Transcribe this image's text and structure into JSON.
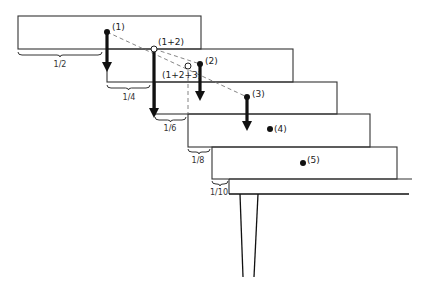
{
  "diagram": {
    "colors": {
      "stroke": "#333333",
      "arrow": "#111111",
      "dash": "#777777",
      "background": "#ffffff"
    },
    "blocks": [
      {
        "id": 1,
        "x": 18,
        "y": 16,
        "w": 183,
        "h": 33
      },
      {
        "id": 2,
        "x": 107,
        "y": 49,
        "w": 186,
        "h": 33
      },
      {
        "id": 3,
        "x": 155,
        "y": 82,
        "w": 182,
        "h": 32
      },
      {
        "id": 4,
        "x": 188,
        "y": 114,
        "w": 182,
        "h": 33
      },
      {
        "id": 5,
        "x": 212,
        "y": 147,
        "w": 185,
        "h": 32
      }
    ],
    "table": {
      "top_y": 179,
      "bottom_y": 194,
      "left_x": 229,
      "right_top_x": 412,
      "right_bottom_x": 409
    },
    "legs": [
      {
        "x1": 240,
        "y1": 194,
        "x2": 243,
        "y2": 277
      },
      {
        "x1": 258,
        "y1": 194,
        "x2": 254,
        "y2": 277
      }
    ],
    "points": [
      {
        "label": "(1)",
        "x": 107,
        "y": 32,
        "type": "filled",
        "label_dx": 5,
        "label_dy": -2
      },
      {
        "label": "(1+2)",
        "x": 154,
        "y": 49,
        "type": "open",
        "label_dx": 4,
        "label_dy": -4
      },
      {
        "label": "(1+2+3)",
        "x": 188,
        "y": 66,
        "type": "open",
        "label_dx": -26,
        "label_dy": 12
      },
      {
        "label": "(2)",
        "x": 200,
        "y": 64,
        "type": "filled",
        "label_dx": 5,
        "label_dy": 0
      },
      {
        "label": "(3)",
        "x": 247,
        "y": 97,
        "type": "filled",
        "label_dx": 5,
        "label_dy": 0
      },
      {
        "label": "(4)",
        "x": 270,
        "y": 129,
        "type": "filled",
        "label_dx": 4,
        "label_dy": 3
      },
      {
        "label": "(5)",
        "x": 303,
        "y": 163,
        "type": "filled",
        "label_dx": 4,
        "label_dy": 0
      }
    ],
    "arrows": [
      {
        "x": 107,
        "y1": 32,
        "y2": 72
      },
      {
        "x": 154,
        "y1": 49,
        "y2": 118
      },
      {
        "x": 200,
        "y1": 64,
        "y2": 101
      },
      {
        "x": 247,
        "y1": 97,
        "y2": 131
      }
    ],
    "dashed_lines": [
      {
        "x1": 107,
        "y1": 32,
        "x2": 247,
        "y2": 97
      },
      {
        "x1": 154,
        "y1": 49,
        "x2": 200,
        "y2": 64
      },
      {
        "x1": 188,
        "y1": 70,
        "x2": 188,
        "y2": 114
      }
    ],
    "braces": [
      {
        "label": "1/2",
        "x1": 18,
        "x2": 102,
        "y": 55,
        "label_x": 60,
        "label_y": 67
      },
      {
        "label": "1/4",
        "x1": 107,
        "x2": 150,
        "y": 88,
        "label_x": 129,
        "label_y": 100
      },
      {
        "label": "1/6",
        "x1": 155,
        "x2": 186,
        "y": 120,
        "label_x": 170,
        "label_y": 131
      },
      {
        "label": "1/8",
        "x1": 188,
        "x2": 210,
        "y": 152,
        "label_x": 198,
        "label_y": 163
      },
      {
        "label": "1/10",
        "x1": 212,
        "x2": 228,
        "y": 184,
        "label_x": 219,
        "label_y": 195
      }
    ]
  }
}
